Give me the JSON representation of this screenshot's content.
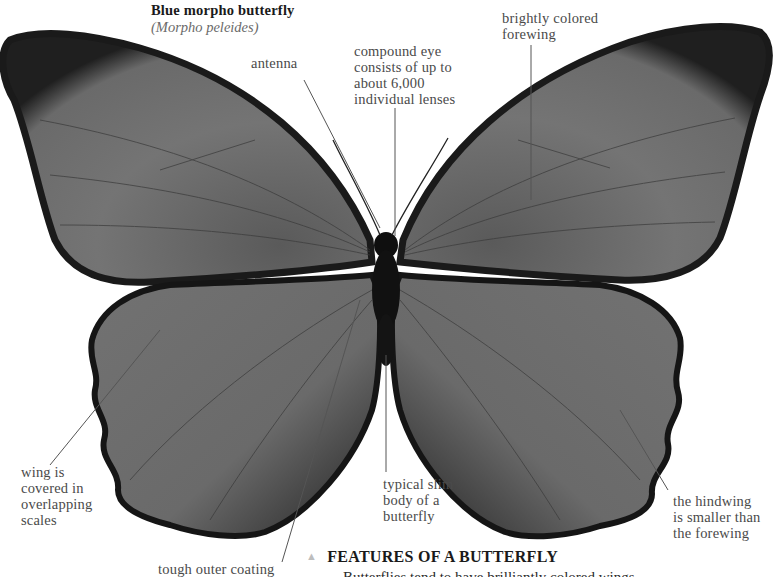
{
  "header": {
    "title": "Blue morpho butterfly",
    "subtitle": "(Morpho peleides)"
  },
  "labels": {
    "antenna": "antenna",
    "compound_eye": "compound eye\nconsists of up to\nabout 6,000\nindividual lenses",
    "forewing": "brightly colored\nforewing",
    "wing_scales": "wing is\ncovered in\noverlapping\nscales",
    "body": "typical slim\nbody of a\nbutterfly",
    "hindwing": "the hindwing\nis smaller than\nthe forewing",
    "coating": "tough outer coating"
  },
  "section": {
    "marker": "▲",
    "heading": "FEATURES OF A BUTTERFLY",
    "body_partial": "Butterflies tend to have brilliantly colored wings"
  },
  "colors": {
    "wing_fill": "#6e6e6e",
    "wing_edge": "#1c1c1c",
    "body": "#111111",
    "leader_line": "#555555",
    "text": "#4a4a4a"
  }
}
